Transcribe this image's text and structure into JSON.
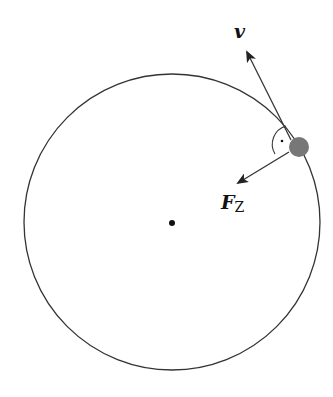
{
  "diagram": {
    "circle": {
      "cx": 172,
      "cy": 222,
      "r": 148,
      "stroke": "#333333"
    },
    "center_point": {
      "x": 172,
      "y": 223
    },
    "mass": {
      "x": 299,
      "y": 147,
      "r": 10,
      "fill": "#777777"
    },
    "velocity_vector": {
      "label": "v",
      "from": [
        291,
        140
      ],
      "to": [
        246,
        50
      ]
    },
    "force_vector": {
      "label_main": "F",
      "label_sub": "Z",
      "from": [
        289,
        153
      ],
      "to": [
        236,
        184
      ]
    },
    "right_angle_marker": {
      "dot": [
        282,
        141
      ]
    },
    "colors": {
      "line": "#333333",
      "mass": "#777777",
      "text": "#111111"
    }
  }
}
